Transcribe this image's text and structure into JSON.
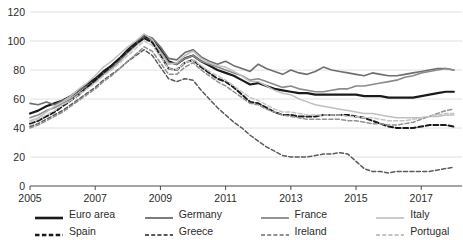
{
  "chart_data": {
    "type": "line",
    "title": "",
    "xlabel": "",
    "ylabel": "",
    "ylim": [
      0,
      120
    ],
    "yticks": [
      0,
      20,
      40,
      60,
      80,
      100,
      120
    ],
    "xlim": [
      2005,
      2018.25
    ],
    "xticks": [
      2005,
      2007,
      2009,
      2011,
      2013,
      2015,
      2017
    ],
    "xtick_labels": [
      "2005",
      "2007",
      "2009",
      "2011",
      "2013",
      "2015",
      "2017"
    ],
    "grid": "horizontal",
    "legend_position": "below",
    "x": [
      2005,
      2005.25,
      2005.5,
      2005.75,
      2006,
      2006.25,
      2006.5,
      2006.75,
      2007,
      2007.25,
      2007.5,
      2007.75,
      2008,
      2008.25,
      2008.5,
      2008.75,
      2009,
      2009.25,
      2009.5,
      2009.75,
      2010,
      2010.25,
      2010.5,
      2010.75,
      2011,
      2011.25,
      2011.5,
      2011.75,
      2012,
      2012.25,
      2012.5,
      2012.75,
      2013,
      2013.25,
      2013.5,
      2013.75,
      2014,
      2014.25,
      2014.5,
      2014.75,
      2015,
      2015.25,
      2015.5,
      2015.75,
      2016,
      2016.25,
      2016.5,
      2016.75,
      2017,
      2017.25,
      2017.5,
      2017.75,
      2018
    ],
    "series": [
      {
        "name": "Euro area",
        "style": "solid",
        "color": "#1a1a1a",
        "width": 2.2,
        "values": [
          50,
          52,
          55,
          57,
          59,
          62,
          66,
          70,
          74,
          79,
          83,
          88,
          94,
          99,
          103,
          101,
          94,
          86,
          84,
          88,
          90,
          86,
          83,
          80,
          78,
          76,
          73,
          70,
          71,
          69,
          67,
          66,
          65,
          64,
          64,
          63,
          63,
          63,
          63,
          63,
          63,
          62,
          62,
          62,
          61,
          61,
          61,
          61,
          62,
          63,
          64,
          65,
          65
        ]
      },
      {
        "name": "Germany",
        "style": "solid",
        "color": "#6e6e6e",
        "width": 1.6,
        "values": [
          57,
          56,
          58,
          56,
          59,
          62,
          66,
          69,
          73,
          78,
          82,
          87,
          93,
          98,
          104,
          102,
          96,
          88,
          87,
          92,
          94,
          89,
          86,
          84,
          86,
          83,
          81,
          79,
          84,
          81,
          79,
          77,
          80,
          78,
          77,
          79,
          82,
          80,
          79,
          78,
          77,
          76,
          78,
          77,
          76,
          76,
          77,
          78,
          79,
          80,
          81,
          81,
          80
        ]
      },
      {
        "name": "France",
        "style": "solid",
        "color": "#8a8a8a",
        "width": 1.6,
        "values": [
          47,
          49,
          52,
          54,
          57,
          60,
          64,
          68,
          72,
          77,
          81,
          86,
          92,
          97,
          102,
          100,
          93,
          85,
          84,
          88,
          90,
          86,
          84,
          82,
          80,
          78,
          76,
          73,
          74,
          72,
          70,
          68,
          69,
          67,
          66,
          65,
          65,
          66,
          67,
          67,
          69,
          69,
          70,
          71,
          72,
          73,
          75,
          76,
          78,
          79,
          80,
          81,
          80
        ]
      },
      {
        "name": "Italy",
        "style": "solid",
        "color": "#bfbfbf",
        "width": 1.5,
        "values": [
          45,
          47,
          51,
          55,
          58,
          62,
          67,
          71,
          76,
          82,
          86,
          91,
          96,
          100,
          105,
          101,
          92,
          84,
          85,
          90,
          93,
          88,
          85,
          83,
          82,
          79,
          76,
          72,
          72,
          69,
          66,
          64,
          63,
          60,
          58,
          56,
          55,
          54,
          53,
          52,
          51,
          50,
          50,
          49,
          48,
          47,
          47,
          47,
          47,
          48,
          48,
          49,
          49
        ]
      },
      {
        "name": "Spain",
        "style": "dashed",
        "color": "#1a1a1a",
        "width": 2.0,
        "values": [
          43,
          45,
          48,
          51,
          55,
          59,
          63,
          68,
          73,
          78,
          83,
          88,
          93,
          98,
          102,
          99,
          90,
          81,
          80,
          85,
          87,
          82,
          78,
          74,
          72,
          68,
          63,
          58,
          57,
          54,
          51,
          49,
          49,
          48,
          48,
          48,
          49,
          49,
          49,
          49,
          48,
          47,
          45,
          43,
          41,
          40,
          40,
          40,
          41,
          42,
          42,
          42,
          41
        ]
      },
      {
        "name": "Greece",
        "style": "dashed",
        "color": "#5a5a5a",
        "width": 1.5,
        "values": [
          41,
          43,
          46,
          49,
          52,
          56,
          60,
          64,
          68,
          73,
          77,
          81,
          86,
          90,
          94,
          90,
          82,
          74,
          72,
          74,
          73,
          66,
          60,
          54,
          49,
          44,
          40,
          35,
          31,
          27,
          24,
          21,
          20,
          20,
          20,
          21,
          22,
          22,
          23,
          22,
          17,
          12,
          10,
          10,
          9,
          10,
          10,
          10,
          10,
          10,
          11,
          12,
          13
        ]
      },
      {
        "name": "Ireland",
        "style": "dashed",
        "color": "#909090",
        "width": 1.5,
        "values": [
          40,
          42,
          45,
          48,
          51,
          55,
          59,
          63,
          67,
          72,
          76,
          81,
          86,
          91,
          96,
          93,
          85,
          77,
          77,
          82,
          85,
          80,
          76,
          72,
          69,
          65,
          61,
          57,
          56,
          53,
          51,
          49,
          48,
          47,
          46,
          46,
          46,
          46,
          46,
          45,
          45,
          44,
          43,
          43,
          42,
          42,
          43,
          44,
          46,
          48,
          50,
          52,
          53
        ]
      },
      {
        "name": "Portugal",
        "style": "dashed",
        "color": "#c4c4c4",
        "width": 1.5,
        "values": [
          44,
          46,
          49,
          52,
          56,
          59,
          63,
          67,
          71,
          76,
          80,
          85,
          90,
          95,
          100,
          97,
          89,
          81,
          80,
          85,
          87,
          83,
          79,
          76,
          73,
          69,
          65,
          61,
          59,
          56,
          53,
          51,
          51,
          50,
          49,
          49,
          49,
          49,
          49,
          48,
          48,
          47,
          47,
          46,
          45,
          45,
          45,
          46,
          47,
          48,
          49,
          50,
          50
        ]
      }
    ]
  },
  "legend": {
    "items": [
      {
        "label": "Euro area",
        "style": "solid",
        "color": "#1a1a1a",
        "width": 2.6
      },
      {
        "label": "Germany",
        "style": "solid",
        "color": "#6e6e6e",
        "width": 1.8
      },
      {
        "label": "France",
        "style": "solid",
        "color": "#8a8a8a",
        "width": 1.8
      },
      {
        "label": "Italy",
        "style": "solid",
        "color": "#bfbfbf",
        "width": 1.6
      },
      {
        "label": "Spain",
        "style": "dashed",
        "color": "#1a1a1a",
        "width": 2.4
      },
      {
        "label": "Greece",
        "style": "dashed",
        "color": "#5a5a5a",
        "width": 1.8
      },
      {
        "label": "Ireland",
        "style": "dashed",
        "color": "#909090",
        "width": 1.8
      },
      {
        "label": "Portugal",
        "style": "dashed",
        "color": "#c4c4c4",
        "width": 1.8
      }
    ]
  },
  "axes": {
    "y_tick_labels": [
      "0",
      "20",
      "40",
      "60",
      "80",
      "100",
      "120"
    ],
    "x_tick_labels": [
      "2005",
      "2007",
      "2009",
      "2011",
      "2013",
      "2015",
      "2017"
    ]
  }
}
